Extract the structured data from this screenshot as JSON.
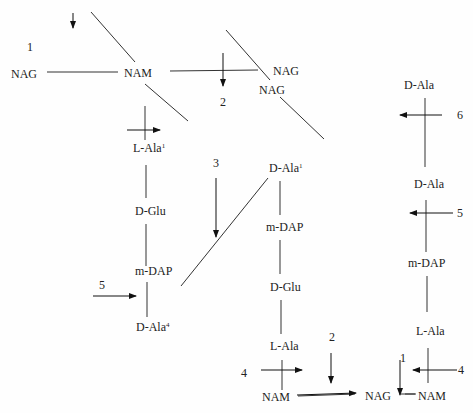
{
  "diagram": {
    "left_strand": {
      "glycan": [
        "NAG",
        "NAM"
      ],
      "peptide": [
        {
          "label": "L-Ala",
          "sup": "1"
        },
        {
          "label": "D-Glu",
          "sup": ""
        },
        {
          "label": "m-DAP",
          "sup": ""
        },
        {
          "label": "D-Ala",
          "sup": "4"
        }
      ]
    },
    "top_right_glycan": [
      "NAG",
      "NAG"
    ],
    "middle_strand": {
      "peptide_top_to_bottom": [
        {
          "label": "D-Ala",
          "sup": "1"
        },
        {
          "label": "m-DAP",
          "sup": ""
        },
        {
          "label": "D-Glu",
          "sup": ""
        },
        {
          "label": "L-Ala",
          "sup": ""
        }
      ],
      "glycan_bottom": [
        "NAM",
        "NAG"
      ]
    },
    "right_strand": {
      "peptide_top_to_bottom": [
        {
          "label": "D-Ala",
          "sup": ""
        },
        {
          "label": "D-Ala",
          "sup": ""
        },
        {
          "label": "m-DAP",
          "sup": ""
        },
        {
          "label": "L-Ala",
          "sup": ""
        }
      ],
      "glycan_bottom": [
        "NAM"
      ]
    },
    "cleavage_sites": [
      "1",
      "2",
      "3",
      "4",
      "5",
      "6",
      "2",
      "4",
      "5",
      "1",
      "4"
    ]
  }
}
